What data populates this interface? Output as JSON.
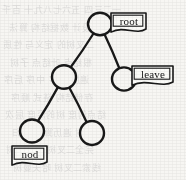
{
  "diagram": {
    "type": "tree",
    "stroke_color": "#181818",
    "background_color": "#f7f6f3",
    "nodes": [
      {
        "id": "root",
        "name": "node-root",
        "cx": 100,
        "cy": 24,
        "r": 12,
        "label": "root"
      },
      {
        "id": "n2",
        "name": "node-internal",
        "cx": 64,
        "cy": 77,
        "r": 12,
        "label": ""
      },
      {
        "id": "n3",
        "name": "node-leave",
        "cx": 124,
        "cy": 79,
        "r": 12,
        "label": "leave"
      },
      {
        "id": "n4",
        "name": "node-nod",
        "cx": 32,
        "cy": 131,
        "r": 12,
        "label": "nod"
      },
      {
        "id": "n5",
        "name": "node-leaf-right",
        "cx": 92,
        "cy": 133,
        "r": 12,
        "label": ""
      }
    ],
    "edges": [
      {
        "name": "edge-root-to-internal",
        "from": "root",
        "to": "n2"
      },
      {
        "name": "edge-root-to-leave",
        "from": "root",
        "to": "n3"
      },
      {
        "name": "edge-internal-to-nod",
        "from": "n2",
        "to": "n4"
      },
      {
        "name": "edge-internal-to-right",
        "from": "n2",
        "to": "n5"
      }
    ],
    "labels": [
      {
        "id": "label-root",
        "text": "root",
        "x": 110,
        "y": 12,
        "w": 36,
        "h": 17
      },
      {
        "id": "label-leave",
        "text": "leave",
        "x": 131,
        "y": 65,
        "w": 42,
        "h": 17
      },
      {
        "id": "label-nod",
        "text": "nod",
        "x": 11,
        "y": 145,
        "w": 36,
        "h": 17
      }
    ]
  },
  "background_ghost_text": {
    "description": "faint scanned bleed-through text from reverse of page",
    "lines": [
      "一二三四 五六七八九十 百千",
      "程序设计 数据结构 算法",
      "二叉树的 定义与 性质",
      "根结点 叶结点 子树",
      "遍历 先序 中序 后序",
      "存储结构 链式 顺序",
      "结点的度 树的深度 层次",
      "二叉树 遍历算法 递归",
      "完全二叉树 满二叉树",
      "线索二叉树 哈夫曼树"
    ]
  }
}
